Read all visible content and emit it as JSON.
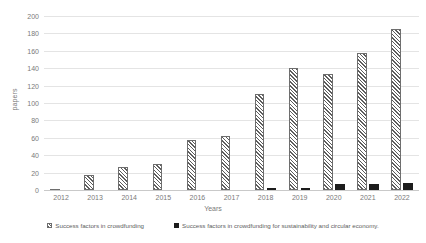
{
  "chart_data": {
    "type": "bar",
    "title": "",
    "xlabel": "Years",
    "ylabel": "papers",
    "categories": [
      "2012",
      "2013",
      "2014",
      "2015",
      "2016",
      "2017",
      "2018",
      "2019",
      "2020",
      "2021",
      "2022"
    ],
    "ylim": [
      0,
      200
    ],
    "yticks": [
      0,
      20,
      40,
      60,
      80,
      100,
      120,
      140,
      160,
      180,
      200
    ],
    "grid": true,
    "legend_position": "bottom",
    "series": [
      {
        "name": "Success factors in crowdfunding",
        "style": "hatched",
        "color": "#5d5d5d",
        "values": [
          1,
          17,
          26,
          30,
          57,
          62,
          110,
          140,
          133,
          158,
          185
        ]
      },
      {
        "name": "Success factors in crowdfunding for sustainability and circular economy.",
        "style": "solid",
        "color": "#1c1c1c",
        "values": [
          0,
          0,
          0,
          0,
          0,
          0,
          2,
          2,
          7,
          7,
          8
        ]
      }
    ]
  }
}
